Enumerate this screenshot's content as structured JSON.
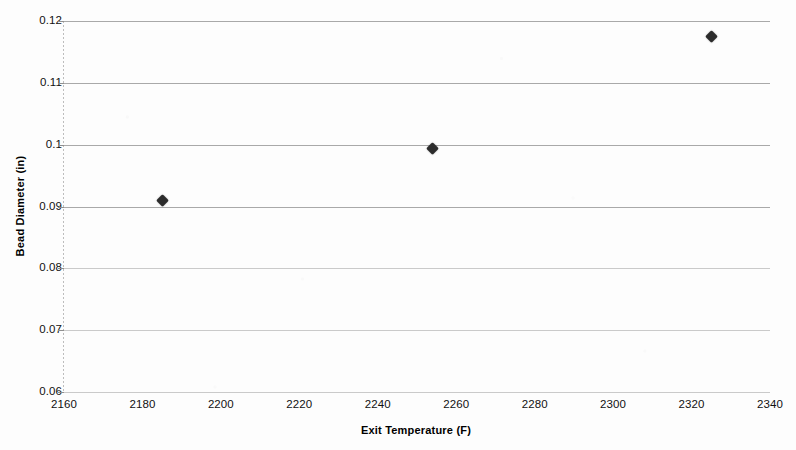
{
  "chart_data": {
    "type": "scatter",
    "title": "",
    "xlabel": "Exit Temperature (F)",
    "ylabel": "Bead Diameter (in)",
    "xlim": [
      2160,
      2340
    ],
    "ylim": [
      0.06,
      0.12
    ],
    "xticks": [
      "2160",
      "2180",
      "2200",
      "2220",
      "2240",
      "2260",
      "2280",
      "2300",
      "2320",
      "2340"
    ],
    "xtick_values": [
      2160,
      2180,
      2200,
      2220,
      2240,
      2260,
      2280,
      2300,
      2320,
      2340
    ],
    "yticks": [
      "0.06",
      "0.07",
      "0.08",
      "0.09",
      "0.1",
      "0.11",
      "0.12"
    ],
    "ytick_values": [
      0.06,
      0.07,
      0.08,
      0.09,
      0.1,
      0.11,
      0.12
    ],
    "grid": "horizontal",
    "legend": "none",
    "marker_shape": "diamond",
    "marker_color": "#2c2c2c",
    "gridline_color": "#9a9a9a",
    "background_color": "#fdfdfd",
    "series": [
      {
        "name": "Bead Diameter",
        "x": [
          2185,
          2254,
          2325
        ],
        "y": [
          0.091,
          0.0993,
          0.1175
        ],
        "points": [
          {
            "x": 2185,
            "y": 0.091
          },
          {
            "x": 2254,
            "y": 0.0993
          },
          {
            "x": 2325,
            "y": 0.1175
          }
        ]
      }
    ]
  }
}
